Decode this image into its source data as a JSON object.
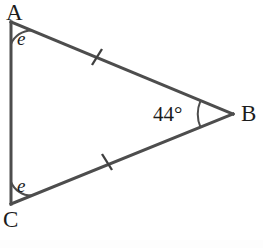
{
  "figure": {
    "kind": "geometry-diagram",
    "shape": "triangle",
    "background_color": "#ffffff",
    "stroke_color": "#4d4d4d",
    "text_color": "#1c1c1c",
    "stroke_width": 3,
    "vertices": [
      {
        "name": "A",
        "label": "A",
        "x": 11,
        "y": 22,
        "label_x": 6,
        "label_y": 1
      },
      {
        "name": "C",
        "label": "C",
        "x": 11,
        "y": 204,
        "label_x": 3,
        "label_y": 208
      },
      {
        "name": "B",
        "label": "B",
        "x": 233,
        "y": 114,
        "label_x": 241,
        "label_y": 102
      }
    ],
    "sides": [
      {
        "name": "AC",
        "from": "A",
        "to": "C",
        "tick_marks": 0
      },
      {
        "name": "AB",
        "from": "A",
        "to": "B",
        "tick_marks": 1,
        "tick_x": 97,
        "tick_y": 57
      },
      {
        "name": "CB",
        "from": "C",
        "to": "B",
        "tick_marks": 1,
        "tick_x": 107,
        "tick_y": 162
      }
    ],
    "angles": [
      {
        "at": "A",
        "label": "e",
        "label_kind": "italic-variable",
        "arc_radius": 22,
        "label_x": 17,
        "label_y": 29
      },
      {
        "at": "C",
        "label": "e",
        "label_kind": "italic-variable",
        "arc_radius": 22,
        "label_x": 17,
        "label_y": 176
      },
      {
        "at": "B",
        "label": "44°",
        "label_kind": "measure",
        "arc_radius": 35,
        "label_x": 153,
        "label_y": 104
      }
    ]
  }
}
